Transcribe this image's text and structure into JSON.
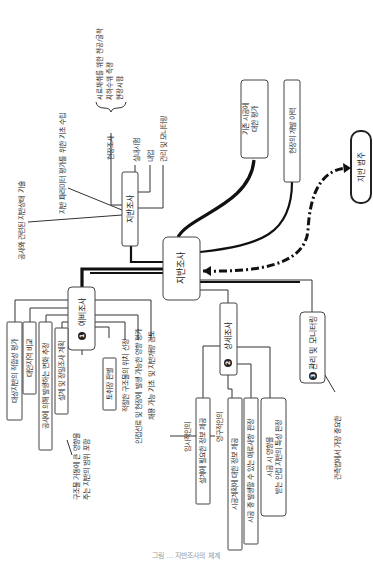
{
  "diagram": {
    "orientation": "rotated-90-ccw",
    "central": {
      "label": "지반조사"
    },
    "ground_info_node": {
      "label": "지반조사",
      "branches": [
        "현장조사",
        "실내시험",
        "내업",
        "관리 및 모니터링"
      ],
      "field_test_items": [
        "시료채취를 위한 천공/굴착",
        "지하수위 측정",
        "현장시험"
      ],
      "notes": [
        "지반 파라미터 평가를 위한 기초 수립",
        "공사와 관련된 지반상태 기술"
      ]
    },
    "existing_evaluation": {
      "label": "기존 시공에 대한 평가"
    },
    "site_history": {
      "label": "현장의 개발 이력"
    },
    "ground_category": {
      "label": "지반 범주"
    },
    "preliminary": {
      "number": "1",
      "label": "예비조사",
      "boxed_items": [
        "대상지반의 적합성 평가",
        "대안지역 비교",
        "공사에 의해 발생하는 변화 추정",
        "설계 및 정밀조사 계획",
        "토취장 판별"
      ],
      "items": [
        "적절한 구조물의 위치 선정",
        "인접선로 및 현장에 발생 가능한 영향 평가",
        "채용 가능 기초 및 지반개량 검토"
      ],
      "note": "구조물 거동에 큰 영향을 주는 지반의 범위 포함"
    },
    "detailed": {
      "number": "2",
      "label": "상세조사",
      "boxed_items": [
        "설계에 필요한 정보 제공",
        "시공계획에 대한 정보 제공",
        "시공 중 발생할 수 있는 애로사항 판정",
        "시공 시 영향을 받는 인접 지반의 특성 판정"
      ],
      "side_labels": [
        "임시적인의",
        "영구적인의"
      ]
    },
    "monitoring": {
      "number": "3",
      "label": "관리 및 모니터링",
      "note": "관측법에서 가장 중요한"
    },
    "caption": "그림 ... 지반조사의 체계"
  }
}
